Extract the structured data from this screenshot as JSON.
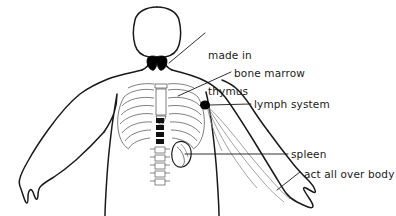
{
  "figure": {
    "background_color": "#ffffff",
    "line_color": "#1a1a1a",
    "fill_color": "#000000"
  },
  "labels": {
    "thymus": {
      "line1": "made in",
      "line2": "thymus",
      "full": "made in thymus",
      "points_to": "thymus-organ"
    },
    "bone_marrow": {
      "text": "bone marrow",
      "points_to": "ribcage-sternum"
    },
    "lymph_system": {
      "text": "lymph system",
      "points_to": "axillary-lymph-node"
    },
    "spleen": {
      "text": "spleen",
      "points_to": "spleen-organ"
    },
    "act_all_over_body": {
      "text": "act all over body",
      "points_to": "right-arm-lymph-vessels"
    }
  },
  "anatomy": {
    "parts": [
      {
        "name": "head",
        "label": "head"
      },
      {
        "name": "neck",
        "label": "neck"
      },
      {
        "name": "torso",
        "label": "torso"
      },
      {
        "name": "left-arm",
        "label": "left arm"
      },
      {
        "name": "right-arm",
        "label": "right arm"
      },
      {
        "name": "thymus-organ",
        "label": "thymus"
      },
      {
        "name": "ribcage",
        "label": "ribcage"
      },
      {
        "name": "sternum",
        "label": "sternum"
      },
      {
        "name": "spine",
        "label": "spine"
      },
      {
        "name": "spleen-organ",
        "label": "spleen"
      },
      {
        "name": "axillary-lymph-node",
        "label": "axillary lymph node"
      },
      {
        "name": "lymph-vessels",
        "label": "lymph vessels"
      }
    ]
  }
}
